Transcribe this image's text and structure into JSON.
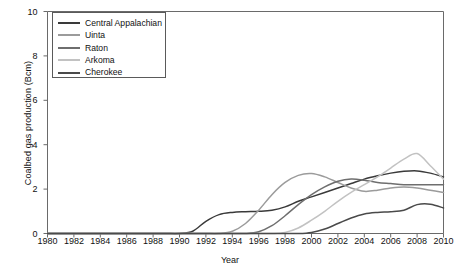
{
  "chart_data": {
    "type": "line",
    "title": "",
    "xlabel": "Year",
    "ylabel": "Coalbed gas production (Bcm)",
    "xlim": [
      1980,
      2010
    ],
    "ylim": [
      0,
      10
    ],
    "xticks": [
      1980,
      1982,
      1984,
      1986,
      1988,
      1990,
      1992,
      1994,
      1996,
      1998,
      2000,
      2002,
      2004,
      2006,
      2008,
      2010
    ],
    "yticks": [
      0,
      2,
      4,
      6,
      8,
      10
    ],
    "grid": false,
    "legend_position": "upper-left",
    "x": [
      1980,
      1981,
      1982,
      1983,
      1984,
      1985,
      1986,
      1987,
      1988,
      1989,
      1990,
      1991,
      1992,
      1993,
      1994,
      1995,
      1996,
      1997,
      1998,
      1999,
      2000,
      2001,
      2002,
      2003,
      2004,
      2005,
      2006,
      2007,
      2008,
      2009,
      2010
    ],
    "series": [
      {
        "name": "Central Appalachian",
        "color": "#3a3a3a",
        "values": [
          0,
          0,
          0,
          0,
          0,
          0,
          0,
          0,
          0,
          0,
          0,
          0.1,
          0.55,
          0.85,
          0.95,
          0.98,
          1.0,
          1.05,
          1.2,
          1.45,
          1.65,
          1.85,
          2.05,
          2.25,
          2.45,
          2.6,
          2.72,
          2.8,
          2.82,
          2.72,
          2.55
        ]
      },
      {
        "name": "Uinta",
        "color": "#9b9b9b",
        "values": [
          0,
          0,
          0,
          0,
          0,
          0,
          0,
          0,
          0,
          0,
          0,
          0,
          0,
          0,
          0.1,
          0.45,
          1.05,
          1.75,
          2.3,
          2.62,
          2.7,
          2.55,
          2.3,
          2.05,
          1.9,
          1.95,
          2.05,
          2.1,
          2.05,
          1.95,
          1.85
        ]
      },
      {
        "name": "Raton",
        "color": "#6e6e6e",
        "values": [
          0,
          0,
          0,
          0,
          0,
          0,
          0,
          0,
          0,
          0,
          0,
          0,
          0,
          0,
          0,
          0,
          0.08,
          0.35,
          0.8,
          1.3,
          1.75,
          2.1,
          2.35,
          2.45,
          2.4,
          2.3,
          2.25,
          2.2,
          2.2,
          2.2,
          2.2
        ]
      },
      {
        "name": "Arkoma",
        "color": "#c2c2c2",
        "values": [
          0,
          0,
          0,
          0,
          0,
          0,
          0,
          0,
          0,
          0,
          0,
          0,
          0,
          0,
          0,
          0,
          0,
          0,
          0.05,
          0.25,
          0.6,
          1.0,
          1.45,
          1.85,
          2.2,
          2.55,
          2.95,
          3.35,
          3.6,
          3.05,
          2.45
        ]
      },
      {
        "name": "Cherokee",
        "color": "#4a4a4a",
        "values": [
          0,
          0,
          0,
          0,
          0,
          0,
          0,
          0,
          0,
          0,
          0,
          0,
          0,
          0,
          0,
          0,
          0,
          0,
          0,
          0,
          0.05,
          0.2,
          0.45,
          0.7,
          0.88,
          0.95,
          0.98,
          1.05,
          1.3,
          1.32,
          1.15
        ]
      }
    ]
  }
}
